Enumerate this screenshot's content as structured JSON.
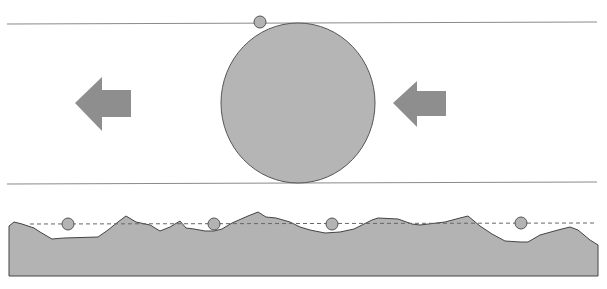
{
  "diagram": {
    "title": "",
    "colors": {
      "background": "#ffffff",
      "fill": "#b3b3b3",
      "stroke": "#555555",
      "arrow": "#8e8e8e",
      "line": "#8a8a8a",
      "dashed": "#666666"
    },
    "top_panel": {
      "upper_line_y": 24,
      "lower_line_y": 183,
      "large_circle": {
        "cx": 298,
        "cy": 103,
        "r": 78
      },
      "small_circle": {
        "cx": 260,
        "cy": 22,
        "r": 6
      },
      "arrows": [
        {
          "name": "left-arrow",
          "direction": "left",
          "x": 75,
          "y": 78
        },
        {
          "name": "right-arrow",
          "direction": "left",
          "x": 393,
          "y": 82
        }
      ]
    },
    "bottom_panel": {
      "dashed_line_y": 224,
      "small_circles": [
        {
          "cx": 68,
          "cy": 224,
          "r": 6
        },
        {
          "cx": 214,
          "cy": 224,
          "r": 6
        },
        {
          "cx": 332,
          "cy": 224,
          "r": 6
        },
        {
          "cx": 521,
          "cy": 223,
          "r": 6
        }
      ],
      "labels": []
    }
  }
}
